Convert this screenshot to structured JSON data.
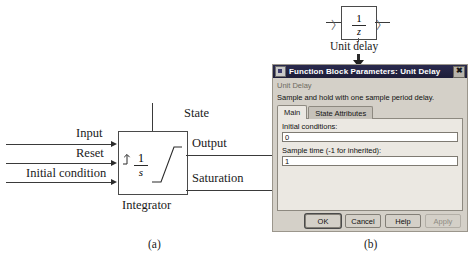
{
  "figure": {
    "panel_a_caption": "(a)",
    "panel_b_caption": "(b)"
  },
  "integrator": {
    "block_label": "Integrator",
    "transfer_numerator": "1",
    "transfer_denominator": "s",
    "reset_icon": "reset-trigger-icon",
    "saturation_icon": "saturation-ramp-icon",
    "inputs": [
      {
        "label": "Input"
      },
      {
        "label": "Reset"
      },
      {
        "label": "Initial condition"
      }
    ],
    "outputs": [
      {
        "label": "State"
      },
      {
        "label": "Output"
      },
      {
        "label": "Saturation"
      }
    ]
  },
  "unit_delay_block": {
    "label": "Unit delay",
    "transfer_numerator": "1",
    "transfer_denominator": "z",
    "input_port": "〉",
    "output_port": "〉"
  },
  "dialog": {
    "title": "Function Block Parameters: Unit Delay",
    "title_icon": "block-parameters-icon",
    "close_icon": "close-icon",
    "heading": "Unit Delay",
    "description": "Sample and hold with one sample period delay.",
    "tabs": [
      {
        "label": "Main",
        "active": true
      },
      {
        "label": "State Attributes",
        "active": false
      }
    ],
    "fields": [
      {
        "label": "Initial conditions:",
        "value": "0"
      },
      {
        "label": "Sample time (-1 for inherited):",
        "value": "1"
      }
    ],
    "buttons": [
      {
        "label": "OK",
        "state": "default"
      },
      {
        "label": "Cancel",
        "state": "normal"
      },
      {
        "label": "Help",
        "state": "normal"
      },
      {
        "label": "Apply",
        "state": "disabled"
      }
    ]
  }
}
